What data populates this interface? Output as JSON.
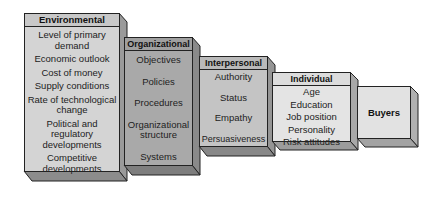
{
  "diagram": {
    "boxes": [
      {
        "id": "environmental",
        "title": "Environmental",
        "items": [
          "Level of primary\ndemand",
          "Economic outlook",
          "Cost of money",
          "Supply conditions",
          "Rate of technological\nchange",
          "Political and\nregulatory\ndevelopments",
          "Competitive\ndevelopments"
        ]
      },
      {
        "id": "organizational",
        "title": "Organizational",
        "items": [
          "Objectives",
          "Policies",
          "Procedures",
          "Organizational\nstructure",
          "Systems"
        ]
      },
      {
        "id": "interpersonal",
        "title": "Interpersonal",
        "items": [
          "Authority",
          "Status",
          "Empathy",
          "Persuasiveness"
        ]
      },
      {
        "id": "individual",
        "title": "Individual",
        "items": [
          "Age",
          "Education",
          "Job position",
          "Personality",
          "Risk attitudes"
        ]
      },
      {
        "id": "buyers",
        "title": "Buyers",
        "items": []
      }
    ],
    "colors": {
      "environmental_face": "#d4d4d4",
      "organizational_face": "#a9a9a9",
      "interpersonal_face": "#c4c4c4",
      "individual_face": "#e4e4e4",
      "buyers_face": "#e2e2e2",
      "outline": "#222222"
    }
  }
}
